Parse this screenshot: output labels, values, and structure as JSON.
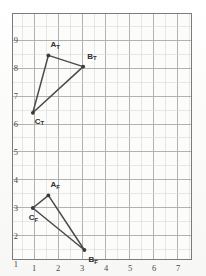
{
  "figure": {
    "kind": "graph-paper-plot",
    "background_color": "#fcfcfb",
    "frame_color": "#7b7b7b",
    "major_grid_color": "#a9a9a9",
    "minor_grid_color": "#d8d8d8",
    "line_color": "#4a4a4a",
    "vertex_color": "#3a3a3a"
  },
  "axes": {
    "x_ticks": [
      "1",
      "2",
      "3",
      "4",
      "5",
      "6",
      "7"
    ],
    "x_tick_values": [
      1,
      2,
      3,
      4,
      5,
      6,
      7
    ],
    "y_ticks": [
      "9",
      "8",
      "7",
      "6",
      "5",
      "4",
      "3",
      "2",
      "1"
    ],
    "y_tick_values": [
      9,
      8,
      7,
      6,
      5,
      4,
      3,
      2,
      1
    ],
    "xlim": [
      0,
      7.5
    ],
    "ylim": [
      0.3,
      9.7
    ],
    "major_step": 1,
    "minor_step": 0.5,
    "grid": true
  },
  "chart_data": {
    "type": "scatter",
    "title": "",
    "xlabel": "",
    "ylabel": "",
    "xlim": [
      0,
      7.5
    ],
    "ylim": [
      0.3,
      9.7
    ],
    "grid": true,
    "legend": "none",
    "series": [
      {
        "name": "Triangle T",
        "closed": true,
        "points": [
          {
            "label": "A",
            "subscript": "T",
            "x": 1.6,
            "y": 8.45,
            "label_dx": 2,
            "label_dy": -10
          },
          {
            "label": "B",
            "subscript": "T",
            "x": 3.05,
            "y": 8.05,
            "label_dx": 4,
            "label_dy": -10
          },
          {
            "label": "C",
            "subscript": "T",
            "x": 0.95,
            "y": 6.4,
            "label_dx": 2,
            "label_dy": 9
          }
        ]
      },
      {
        "name": "Triangle F",
        "closed": true,
        "points": [
          {
            "label": "A",
            "subscript": "F",
            "x": 1.6,
            "y": 3.45,
            "label_dx": 2,
            "label_dy": -10
          },
          {
            "label": "B",
            "subscript": "F",
            "x": 3.1,
            "y": 1.5,
            "label_dx": 4,
            "label_dy": 10
          },
          {
            "label": "C",
            "subscript": "F",
            "x": 0.95,
            "y": 3.0,
            "label_dx": -4,
            "label_dy": 10
          }
        ]
      }
    ]
  },
  "vertex_labels": [
    {
      "name": "label-a-t",
      "text": "A",
      "sub": "T"
    },
    {
      "name": "label-b-t",
      "text": "B",
      "sub": "T"
    },
    {
      "name": "label-c-t",
      "text": "C",
      "sub": "T"
    },
    {
      "name": "label-a-f",
      "text": "A",
      "sub": "F"
    },
    {
      "name": "label-b-f",
      "text": "B",
      "sub": "F"
    },
    {
      "name": "label-c-f",
      "text": "C",
      "sub": "F"
    }
  ]
}
